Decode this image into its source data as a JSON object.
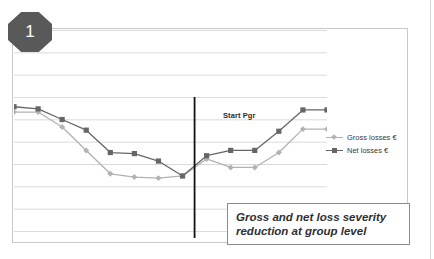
{
  "badge": {
    "number": "1"
  },
  "annotations": {
    "start_marker_label": "Start Pgr",
    "caption_line1": "Gross and net loss severity",
    "caption_line2": "reduction at group level",
    "caption_full": "Gross and net loss severity reduction at group level"
  },
  "colors": {
    "badge_fill": "#595959",
    "gross_series": "#b2b2b2",
    "net_series": "#666666",
    "gridline": "#d0d0d0",
    "frame_border": "#c9c9c9",
    "caption_border": "#8c8c8c",
    "start_marker_line": "#111111"
  },
  "chart_data": {
    "type": "line",
    "title": "",
    "subtitle": "",
    "xlabel": "",
    "ylabel": "",
    "grid": true,
    "grid_orientation": "horizontal",
    "gridline_count": 10,
    "legend_position": "right",
    "axis_labels_visible": false,
    "xlim": [
      0,
      13
    ],
    "ylim": [
      0,
      10
    ],
    "x": [
      0,
      1,
      2,
      3,
      4,
      5,
      6,
      7,
      8,
      9,
      10,
      11,
      12,
      13
    ],
    "annotations": [
      {
        "type": "vline",
        "label": "Start Pgr",
        "x": 7.5,
        "color": "#111111"
      }
    ],
    "series": [
      {
        "name": "Net losses €",
        "key": "net",
        "color": "#666666",
        "marker": "square",
        "values": [
          6.35,
          6.25,
          5.75,
          5.25,
          4.2,
          4.15,
          3.8,
          3.1,
          4.05,
          4.3,
          4.3,
          5.2,
          6.2,
          6.2
        ]
      },
      {
        "name": "Gross losses €",
        "key": "gross",
        "color": "#b2b2b2",
        "marker": "diamond",
        "values": [
          6.1,
          6.1,
          5.4,
          4.3,
          3.2,
          3.05,
          3.0,
          3.1,
          3.9,
          3.5,
          3.5,
          4.2,
          5.3,
          5.3
        ]
      }
    ],
    "legend_entries": [
      {
        "label": "Gross losses €",
        "color": "#b2b2b2",
        "marker": "diamond"
      },
      {
        "label": "Net losses €",
        "color": "#666666",
        "marker": "square"
      }
    ]
  }
}
